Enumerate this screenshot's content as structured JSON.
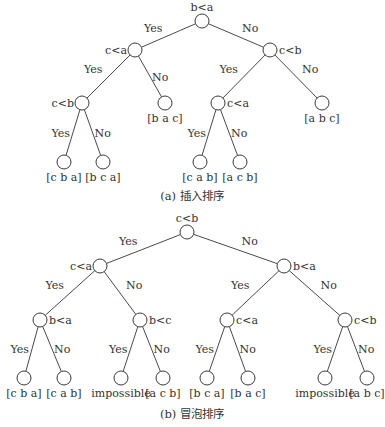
{
  "trees": [
    {
      "id": "insertion",
      "caption": "(a) 插入排序",
      "nodes": [
        {
          "id": "a0",
          "label": "b<a",
          "labelPos": "top"
        },
        {
          "id": "a1",
          "label": "c<a",
          "labelPos": "left"
        },
        {
          "id": "a2",
          "label": "c<b",
          "labelPos": "right"
        },
        {
          "id": "a3",
          "label": "c<b",
          "labelPos": "left"
        },
        {
          "id": "a4",
          "label": "[b a c]",
          "labelPos": "bottom",
          "leaf": true
        },
        {
          "id": "a5",
          "label": "c<a",
          "labelPos": "right"
        },
        {
          "id": "a6",
          "label": "[a b c]",
          "labelPos": "bottom",
          "leaf": true
        },
        {
          "id": "a7",
          "label": "[c b a]",
          "labelPos": "bottom",
          "leaf": true
        },
        {
          "id": "a8",
          "label": "[b c a]",
          "labelPos": "bottom",
          "leaf": true
        },
        {
          "id": "a9",
          "label": "[c a b]",
          "labelPos": "bottom",
          "leaf": true
        },
        {
          "id": "a10",
          "label": "[a c b]",
          "labelPos": "bottom",
          "leaf": true
        }
      ],
      "edges": [
        {
          "from": "a0",
          "to": "a1",
          "label": "Yes"
        },
        {
          "from": "a0",
          "to": "a2",
          "label": "No"
        },
        {
          "from": "a1",
          "to": "a3",
          "label": "Yes"
        },
        {
          "from": "a1",
          "to": "a4",
          "label": "No"
        },
        {
          "from": "a2",
          "to": "a5",
          "label": "Yes"
        },
        {
          "from": "a2",
          "to": "a6",
          "label": "No"
        },
        {
          "from": "a3",
          "to": "a7",
          "label": "Yes"
        },
        {
          "from": "a3",
          "to": "a8",
          "label": "No"
        },
        {
          "from": "a5",
          "to": "a9",
          "label": "Yes"
        },
        {
          "from": "a5",
          "to": "a10",
          "label": "No"
        }
      ]
    },
    {
      "id": "bubble",
      "caption": "(b) 冒泡排序",
      "nodes": [
        {
          "id": "b0",
          "label": "c<b",
          "labelPos": "top"
        },
        {
          "id": "b1",
          "label": "c<a",
          "labelPos": "left"
        },
        {
          "id": "b2",
          "label": "b<a",
          "labelPos": "right"
        },
        {
          "id": "b3",
          "label": "b<a",
          "labelPos": "right"
        },
        {
          "id": "b4",
          "label": "b<c",
          "labelPos": "right"
        },
        {
          "id": "b5",
          "label": "c<a",
          "labelPos": "right"
        },
        {
          "id": "b6",
          "label": "c<b",
          "labelPos": "right"
        },
        {
          "id": "b7",
          "label": "[c b a]",
          "labelPos": "bottom",
          "leaf": true
        },
        {
          "id": "b8",
          "label": "[c a b]",
          "labelPos": "bottom",
          "leaf": true
        },
        {
          "id": "b9",
          "label": "impossible",
          "labelPos": "bottom",
          "leaf": true
        },
        {
          "id": "b10",
          "label": "[a c b]",
          "labelPos": "bottom",
          "leaf": true
        },
        {
          "id": "b11",
          "label": "[b c a]",
          "labelPos": "bottom",
          "leaf": true
        },
        {
          "id": "b12",
          "label": "[b a c]",
          "labelPos": "bottom",
          "leaf": true
        },
        {
          "id": "b13",
          "label": "impossible",
          "labelPos": "bottom",
          "leaf": true
        },
        {
          "id": "b14",
          "label": "[a b c]",
          "labelPos": "bottom",
          "leaf": true
        }
      ],
      "edges": [
        {
          "from": "b0",
          "to": "b1",
          "label": "Yes"
        },
        {
          "from": "b0",
          "to": "b2",
          "label": "No"
        },
        {
          "from": "b1",
          "to": "b3",
          "label": "Yes"
        },
        {
          "from": "b1",
          "to": "b4",
          "label": "No"
        },
        {
          "from": "b2",
          "to": "b5",
          "label": "Yes"
        },
        {
          "from": "b2",
          "to": "b6",
          "label": "No"
        },
        {
          "from": "b3",
          "to": "b7",
          "label": "Yes"
        },
        {
          "from": "b3",
          "to": "b8",
          "label": "No"
        },
        {
          "from": "b4",
          "to": "b9",
          "label": "Yes"
        },
        {
          "from": "b4",
          "to": "b10",
          "label": "No"
        },
        {
          "from": "b5",
          "to": "b11",
          "label": "Yes"
        },
        {
          "from": "b5",
          "to": "b12",
          "label": "No"
        },
        {
          "from": "b6",
          "to": "b13",
          "label": "Yes"
        },
        {
          "from": "b6",
          "to": "b14",
          "label": "No"
        }
      ]
    }
  ]
}
